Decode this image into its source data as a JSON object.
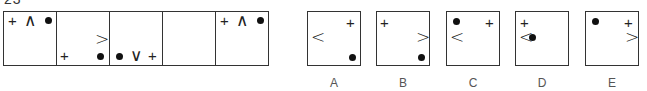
{
  "question": {
    "number": "23"
  },
  "sequence": {
    "cells": [
      {
        "id": "seq-1",
        "symbols": [
          "plus",
          "chevron-up",
          "dot"
        ]
      },
      {
        "id": "seq-2",
        "symbols": [
          "chevron-right",
          "plus",
          "dot"
        ]
      },
      {
        "id": "seq-3",
        "symbols": [
          "dot",
          "chevron-down",
          "plus"
        ]
      },
      {
        "id": "seq-4",
        "symbols": [],
        "blank": true
      },
      {
        "id": "seq-5",
        "symbols": [
          "plus",
          "chevron-up",
          "dot"
        ]
      }
    ]
  },
  "glyphs": {
    "plus": "+",
    "chevron_up": "∧",
    "chevron_down": "∨",
    "chevron_left": "<",
    "chevron_right": ">"
  },
  "options": [
    {
      "label": "A",
      "symbols": [
        "plus top-right",
        "chevron-left middle-left",
        "dot bottom-right"
      ]
    },
    {
      "label": "B",
      "symbols": [
        "plus top-left",
        "chevron-right middle-right",
        "dot bottom-right"
      ]
    },
    {
      "label": "C",
      "symbols": [
        "dot top-left",
        "plus top-right",
        "chevron-left middle-left"
      ]
    },
    {
      "label": "D",
      "symbols": [
        "plus top-left",
        "chevron-left middle-left",
        "dot middle-left"
      ]
    },
    {
      "label": "E",
      "symbols": [
        "dot top-left",
        "plus top-right",
        "chevron-right middle-right"
      ]
    }
  ]
}
